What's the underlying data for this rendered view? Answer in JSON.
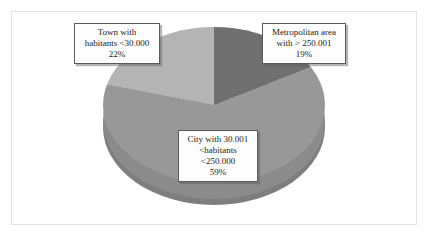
{
  "chart_data": {
    "type": "pie",
    "title": "",
    "subtitle": "",
    "xlabel": "",
    "ylabel": "",
    "legend_position": "none",
    "grid": false,
    "style": "3d-pie",
    "categories": [
      "Town with habitants <30.000",
      "Metropolitan area with > 250.001",
      "City with 30.001 <habitants <250.000"
    ],
    "values": [
      22,
      19,
      59
    ],
    "value_unit": "%",
    "slices": [
      {
        "name": "town",
        "label_lines": [
          "Town with",
          "habitants <30.000",
          "22%"
        ],
        "value": 22,
        "value_text": "22%",
        "color": "#b4b4b4"
      },
      {
        "name": "metropolitan-area",
        "label_lines": [
          "Metropolitan area",
          "with > 250.001",
          "19%"
        ],
        "value": 19,
        "value_text": "19%",
        "color": "#6f6f6f"
      },
      {
        "name": "city",
        "label_lines": [
          "City with 30.001",
          "<habitants",
          "<250.000",
          "59%"
        ],
        "value": 59,
        "value_text": "59%",
        "color": "#989898"
      }
    ]
  },
  "labels": {
    "town": {
      "line1": "Town  with",
      "line2": "habitants <30.000",
      "line3": "22%"
    },
    "metro": {
      "line1": "Metropolitan area",
      "line2": "with > 250.001",
      "line3": "19%"
    },
    "city": {
      "line1": "City  with  30.001",
      "line2": "<habitants",
      "line3": "<250.000",
      "line4": "59%"
    }
  },
  "colors": {
    "town_slice": "#b4b4b4",
    "metro_slice": "#6f6f6f",
    "city_slice": "#989898",
    "pie_depth": "#7e7e7e",
    "frame_border": "#e2e2e2",
    "background": "#ffffff",
    "label_text": "#1c1c1c"
  }
}
